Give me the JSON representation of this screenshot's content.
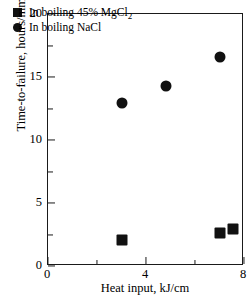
{
  "chart_data": {
    "type": "scatter",
    "title": "",
    "xlabel": "Heat input, kJ/cm",
    "ylabel": "Time-to-failure, hours/mm",
    "ylabel_sup": "2",
    "xlim": [
      0,
      8
    ],
    "ylim": [
      0,
      20
    ],
    "grid": false,
    "legend_position": "upper-left-inside",
    "xticks": [
      0,
      4,
      8
    ],
    "xticklabels": [
      "0",
      "4",
      "8"
    ],
    "xminorticks": [
      2,
      6
    ],
    "yticks": [
      0,
      5,
      10,
      15,
      20
    ],
    "yticklabels": [
      "0",
      "5",
      "10",
      "15",
      "20"
    ],
    "yminorticks": [
      2.5,
      7.5,
      12.5,
      17.5
    ],
    "series": [
      {
        "name": "In boiling 45% MgCl2",
        "legend_label": "In boiling 45% MgCl",
        "legend_sub": "2",
        "marker": "square",
        "color": "#111111",
        "points": [
          {
            "x": 3.0,
            "y": 2.1
          },
          {
            "x": 7.0,
            "y": 2.6
          },
          {
            "x": 7.55,
            "y": 2.9
          }
        ]
      },
      {
        "name": "In boiling NaCl",
        "legend_label": "In boiling NaCl",
        "legend_sub": "",
        "marker": "circle",
        "color": "#111111",
        "points": [
          {
            "x": 3.0,
            "y": 12.9
          },
          {
            "x": 4.8,
            "y": 14.3
          },
          {
            "x": 7.0,
            "y": 16.6
          }
        ]
      }
    ]
  }
}
